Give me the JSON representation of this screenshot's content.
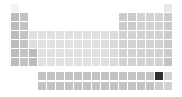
{
  "chart_data": {
    "type": "heatmap",
    "title": "",
    "layout": "periodic-table",
    "colormap": "grayscale",
    "highlighted_element": "Yb",
    "highlight_color": "#2e2e2e",
    "grid": {
      "origin_x": 11,
      "origin_y": 4,
      "pitch": 9,
      "cell_size": 8,
      "fblock_origin_x": 38,
      "fblock_origin_y": 72
    },
    "elements": [
      {
        "s": "H",
        "r": 1,
        "c": 1,
        "v": 0.08
      },
      {
        "s": "He",
        "r": 1,
        "c": 18,
        "v": 0.15
      },
      {
        "s": "Li",
        "r": 2,
        "c": 1,
        "v": 0.45
      },
      {
        "s": "Be",
        "r": 2,
        "c": 2,
        "v": 0.4
      },
      {
        "s": "B",
        "r": 2,
        "c": 13,
        "v": 0.35
      },
      {
        "s": "C",
        "r": 2,
        "c": 14,
        "v": 0.35
      },
      {
        "s": "N",
        "r": 2,
        "c": 15,
        "v": 0.3
      },
      {
        "s": "O",
        "r": 2,
        "c": 16,
        "v": 0.3
      },
      {
        "s": "F",
        "r": 2,
        "c": 17,
        "v": 0.3
      },
      {
        "s": "Ne",
        "r": 2,
        "c": 18,
        "v": 0.35
      },
      {
        "s": "Na",
        "r": 3,
        "c": 1,
        "v": 0.45
      },
      {
        "s": "Mg",
        "r": 3,
        "c": 2,
        "v": 0.4
      },
      {
        "s": "Al",
        "r": 3,
        "c": 13,
        "v": 0.35
      },
      {
        "s": "Si",
        "r": 3,
        "c": 14,
        "v": 0.35
      },
      {
        "s": "P",
        "r": 3,
        "c": 15,
        "v": 0.3
      },
      {
        "s": "S",
        "r": 3,
        "c": 16,
        "v": 0.3
      },
      {
        "s": "Cl",
        "r": 3,
        "c": 17,
        "v": 0.3
      },
      {
        "s": "Ar",
        "r": 3,
        "c": 18,
        "v": 0.35
      },
      {
        "s": "K",
        "r": 4,
        "c": 1,
        "v": 0.45
      },
      {
        "s": "Ca",
        "r": 4,
        "c": 2,
        "v": 0.4
      },
      {
        "s": "Sc",
        "r": 4,
        "c": 3,
        "v": 0.22
      },
      {
        "s": "Ti",
        "r": 4,
        "c": 4,
        "v": 0.2
      },
      {
        "s": "V",
        "r": 4,
        "c": 5,
        "v": 0.2
      },
      {
        "s": "Cr",
        "r": 4,
        "c": 6,
        "v": 0.2
      },
      {
        "s": "Mn",
        "r": 4,
        "c": 7,
        "v": 0.2
      },
      {
        "s": "Fe",
        "r": 4,
        "c": 8,
        "v": 0.2
      },
      {
        "s": "Co",
        "r": 4,
        "c": 9,
        "v": 0.2
      },
      {
        "s": "Ni",
        "r": 4,
        "c": 10,
        "v": 0.2
      },
      {
        "s": "Cu",
        "r": 4,
        "c": 11,
        "v": 0.22
      },
      {
        "s": "Zn",
        "r": 4,
        "c": 12,
        "v": 0.25
      },
      {
        "s": "Ga",
        "r": 4,
        "c": 13,
        "v": 0.3
      },
      {
        "s": "Ge",
        "r": 4,
        "c": 14,
        "v": 0.3
      },
      {
        "s": "As",
        "r": 4,
        "c": 15,
        "v": 0.3
      },
      {
        "s": "Se",
        "r": 4,
        "c": 16,
        "v": 0.3
      },
      {
        "s": "Br",
        "r": 4,
        "c": 17,
        "v": 0.3
      },
      {
        "s": "Kr",
        "r": 4,
        "c": 18,
        "v": 0.35
      },
      {
        "s": "Rb",
        "r": 5,
        "c": 1,
        "v": 0.45
      },
      {
        "s": "Sr",
        "r": 5,
        "c": 2,
        "v": 0.4
      },
      {
        "s": "Y",
        "r": 5,
        "c": 3,
        "v": 0.22
      },
      {
        "s": "Zr",
        "r": 5,
        "c": 4,
        "v": 0.2
      },
      {
        "s": "Nb",
        "r": 5,
        "c": 5,
        "v": 0.2
      },
      {
        "s": "Mo",
        "r": 5,
        "c": 6,
        "v": 0.2
      },
      {
        "s": "Tc",
        "r": 5,
        "c": 7,
        "v": 0.2
      },
      {
        "s": "Ru",
        "r": 5,
        "c": 8,
        "v": 0.2
      },
      {
        "s": "Rh",
        "r": 5,
        "c": 9,
        "v": 0.2
      },
      {
        "s": "Pd",
        "r": 5,
        "c": 10,
        "v": 0.2
      },
      {
        "s": "Ag",
        "r": 5,
        "c": 11,
        "v": 0.22
      },
      {
        "s": "Cd",
        "r": 5,
        "c": 12,
        "v": 0.25
      },
      {
        "s": "In",
        "r": 5,
        "c": 13,
        "v": 0.3
      },
      {
        "s": "Sn",
        "r": 5,
        "c": 14,
        "v": 0.3
      },
      {
        "s": "Sb",
        "r": 5,
        "c": 15,
        "v": 0.3
      },
      {
        "s": "Te",
        "r": 5,
        "c": 16,
        "v": 0.3
      },
      {
        "s": "I",
        "r": 5,
        "c": 17,
        "v": 0.3
      },
      {
        "s": "Xe",
        "r": 5,
        "c": 18,
        "v": 0.35
      },
      {
        "s": "Cs",
        "r": 6,
        "c": 1,
        "v": 0.45
      },
      {
        "s": "Ba",
        "r": 6,
        "c": 2,
        "v": 0.4
      },
      {
        "s": "La*",
        "r": 6,
        "c": 3,
        "v": 0.45
      },
      {
        "s": "Hf",
        "r": 6,
        "c": 4,
        "v": 0.2
      },
      {
        "s": "Ta",
        "r": 6,
        "c": 5,
        "v": 0.2
      },
      {
        "s": "W",
        "r": 6,
        "c": 6,
        "v": 0.2
      },
      {
        "s": "Re",
        "r": 6,
        "c": 7,
        "v": 0.2
      },
      {
        "s": "Os",
        "r": 6,
        "c": 8,
        "v": 0.2
      },
      {
        "s": "Ir",
        "r": 6,
        "c": 9,
        "v": 0.2
      },
      {
        "s": "Pt",
        "r": 6,
        "c": 10,
        "v": 0.2
      },
      {
        "s": "Au",
        "r": 6,
        "c": 11,
        "v": 0.22
      },
      {
        "s": "Hg",
        "r": 6,
        "c": 12,
        "v": 0.25
      },
      {
        "s": "Tl",
        "r": 6,
        "c": 13,
        "v": 0.3
      },
      {
        "s": "Pb",
        "r": 6,
        "c": 14,
        "v": 0.3
      },
      {
        "s": "Bi",
        "r": 6,
        "c": 15,
        "v": 0.3
      },
      {
        "s": "Po",
        "r": 6,
        "c": 16,
        "v": 0.3
      },
      {
        "s": "At",
        "r": 6,
        "c": 17,
        "v": 0.3
      },
      {
        "s": "Rn",
        "r": 6,
        "c": 18,
        "v": 0.35
      },
      {
        "s": "Fr",
        "r": 7,
        "c": 1,
        "v": 0.45
      },
      {
        "s": "Ra",
        "r": 7,
        "c": 2,
        "v": 0.4
      },
      {
        "s": "Ac*",
        "r": 7,
        "c": 3,
        "v": 0.45
      },
      {
        "s": "Rf",
        "r": 7,
        "c": 4,
        "v": 0.2
      },
      {
        "s": "Db",
        "r": 7,
        "c": 5,
        "v": 0.2
      },
      {
        "s": "Sg",
        "r": 7,
        "c": 6,
        "v": 0.2
      },
      {
        "s": "Bh",
        "r": 7,
        "c": 7,
        "v": 0.2
      },
      {
        "s": "Hs",
        "r": 7,
        "c": 8,
        "v": 0.2
      },
      {
        "s": "Mt",
        "r": 7,
        "c": 9,
        "v": 0.2
      },
      {
        "s": "Ds",
        "r": 7,
        "c": 10,
        "v": 0.2
      },
      {
        "s": "Rg",
        "r": 7,
        "c": 11,
        "v": 0.22
      },
      {
        "s": "Cn",
        "r": 7,
        "c": 12,
        "v": 0.25
      },
      {
        "s": "Nh",
        "r": 7,
        "c": 13,
        "v": 0.3
      },
      {
        "s": "Fl",
        "r": 7,
        "c": 14,
        "v": 0.3
      },
      {
        "s": "Mc",
        "r": 7,
        "c": 15,
        "v": 0.3
      },
      {
        "s": "Lv",
        "r": 7,
        "c": 16,
        "v": 0.3
      },
      {
        "s": "Ts",
        "r": 7,
        "c": 17,
        "v": 0.3
      },
      {
        "s": "Og",
        "r": 7,
        "c": 18,
        "v": 0.4
      },
      {
        "s": "La",
        "f": 1,
        "i": 0,
        "v": 0.4
      },
      {
        "s": "Ce",
        "f": 1,
        "i": 1,
        "v": 0.4
      },
      {
        "s": "Pr",
        "f": 1,
        "i": 2,
        "v": 0.4
      },
      {
        "s": "Nd",
        "f": 1,
        "i": 3,
        "v": 0.4
      },
      {
        "s": "Pm",
        "f": 1,
        "i": 4,
        "v": 0.4
      },
      {
        "s": "Sm",
        "f": 1,
        "i": 5,
        "v": 0.4
      },
      {
        "s": "Eu",
        "f": 1,
        "i": 6,
        "v": 0.4
      },
      {
        "s": "Gd",
        "f": 1,
        "i": 7,
        "v": 0.4
      },
      {
        "s": "Tb",
        "f": 1,
        "i": 8,
        "v": 0.4
      },
      {
        "s": "Dy",
        "f": 1,
        "i": 9,
        "v": 0.4
      },
      {
        "s": "Ho",
        "f": 1,
        "i": 10,
        "v": 0.4
      },
      {
        "s": "Er",
        "f": 1,
        "i": 11,
        "v": 0.4
      },
      {
        "s": "Tm",
        "f": 1,
        "i": 12,
        "v": 0.4
      },
      {
        "s": "Yb",
        "f": 1,
        "i": 13,
        "v": 1.0
      },
      {
        "s": "Lu",
        "f": 1,
        "i": 14,
        "v": 0.3
      },
      {
        "s": "Ac",
        "f": 2,
        "i": 0,
        "v": 0.4
      },
      {
        "s": "Th",
        "f": 2,
        "i": 1,
        "v": 0.4
      },
      {
        "s": "Pa",
        "f": 2,
        "i": 2,
        "v": 0.4
      },
      {
        "s": "U",
        "f": 2,
        "i": 3,
        "v": 0.4
      },
      {
        "s": "Np",
        "f": 2,
        "i": 4,
        "v": 0.4
      },
      {
        "s": "Pu",
        "f": 2,
        "i": 5,
        "v": 0.4
      },
      {
        "s": "Am",
        "f": 2,
        "i": 6,
        "v": 0.4
      },
      {
        "s": "Cm",
        "f": 2,
        "i": 7,
        "v": 0.4
      },
      {
        "s": "Bk",
        "f": 2,
        "i": 8,
        "v": 0.4
      },
      {
        "s": "Cf",
        "f": 2,
        "i": 9,
        "v": 0.4
      },
      {
        "s": "Es",
        "f": 2,
        "i": 10,
        "v": 0.4
      },
      {
        "s": "Fm",
        "f": 2,
        "i": 11,
        "v": 0.4
      },
      {
        "s": "Md",
        "f": 2,
        "i": 12,
        "v": 0.4
      },
      {
        "s": "No",
        "f": 2,
        "i": 13,
        "v": 0.35
      },
      {
        "s": "Lr",
        "f": 2,
        "i": 14,
        "v": 0.3
      }
    ]
  }
}
